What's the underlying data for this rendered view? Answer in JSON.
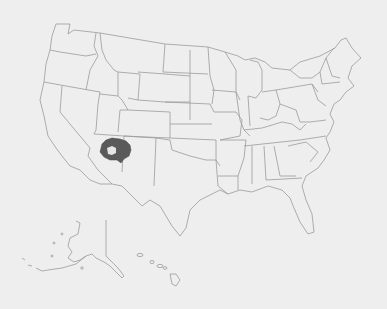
{
  "map": {
    "type": "choropleth",
    "subject": "United States (states, incl. Alaska and Hawaii insets)",
    "highlighted_region": {
      "name": "Navajo Nation area (northeastern Arizona)",
      "fill_color": "#5a5a5a"
    },
    "colors": {
      "background": "#eeeeee",
      "border": "#9a9a9a",
      "highlight": "#5a5a5a"
    }
  }
}
